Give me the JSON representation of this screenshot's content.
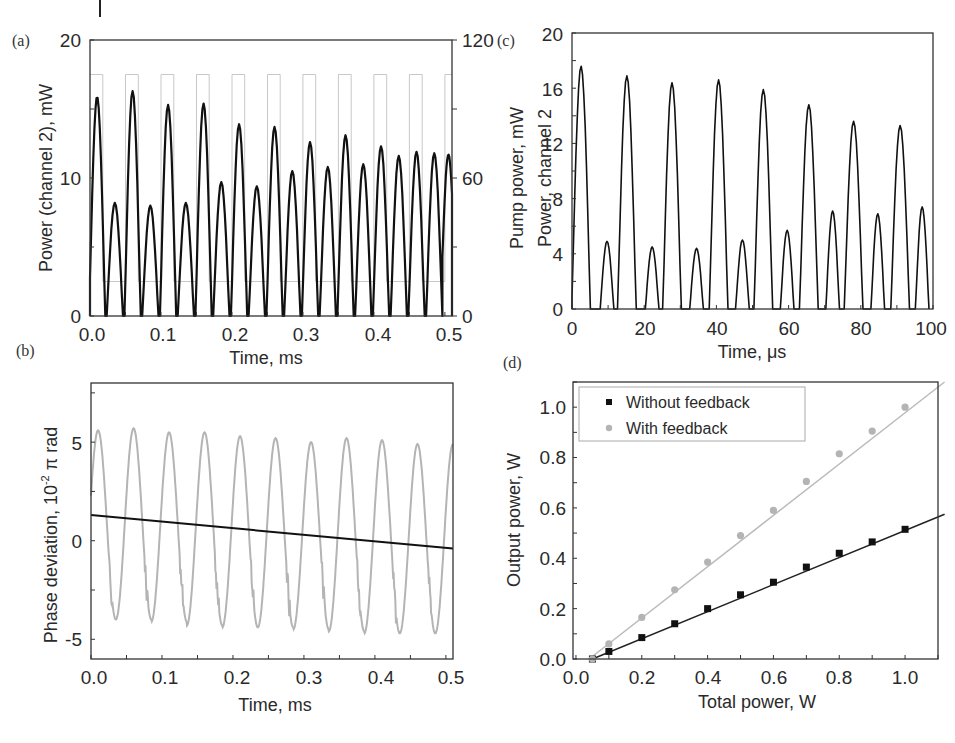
{
  "colors": {
    "black_trace": "#111111",
    "gray_trace": "#b4b4b4",
    "pump_trace": "#c8c8c8",
    "axis": "#333333"
  },
  "panels": {
    "a": {
      "letter": "(a)",
      "xlabel": "Time, ms",
      "ylabel_left": "Power (channel 2), mW",
      "ylabel_right": "Pump power, mW",
      "xticks": [
        "0.0",
        "0.1",
        "0.2",
        "0.3",
        "0.4",
        "0.5"
      ],
      "yticks_left": [
        "0",
        "10",
        "20"
      ],
      "yticks_right": [
        "0",
        "60",
        "120"
      ]
    },
    "b": {
      "letter": "(b)",
      "xlabel": "Time, ms",
      "ylabel": "Phase deviation, 10⁻² π rad",
      "ylabel_main": "Phase deviation, 10",
      "ylabel_sup": "-2",
      "ylabel_tail": " π rad",
      "xticks": [
        "0.0",
        "0.1",
        "0.2",
        "0.3",
        "0.4",
        "0.5"
      ],
      "yticks": [
        "-5",
        "0",
        "5"
      ]
    },
    "c": {
      "letter": "(c)",
      "xlabel": "Time, μs",
      "ylabel": "Power, channel 2",
      "xticks": [
        "0",
        "20",
        "40",
        "60",
        "80",
        "100"
      ],
      "yticks": [
        "0",
        "4",
        "8",
        "12",
        "16",
        "20"
      ]
    },
    "d": {
      "letter": "(d)",
      "xlabel": "Total power, W",
      "ylabel": "Output power, W",
      "xticks": [
        "0.0",
        "0.2",
        "0.4",
        "0.6",
        "0.8",
        "1.0"
      ],
      "yticks": [
        "0.0",
        "0.2",
        "0.4",
        "0.6",
        "0.8",
        "1.0"
      ],
      "legend": [
        "Without feedback",
        "With feedback"
      ]
    }
  },
  "chart_data": [
    {
      "id": "a",
      "type": "line",
      "title": "",
      "xlabel": "Time, ms",
      "ylabel": "Power (channel 2), mW",
      "ylabel_right": "Pump power, mW",
      "xlim": [
        0,
        0.51
      ],
      "ylim": [
        0,
        20
      ],
      "ylim_right": [
        0,
        120
      ],
      "grid": false,
      "series": [
        {
          "name": "Power (channel 2)",
          "axis": "left",
          "color": "#111111",
          "peak_times_ms": [
            0.01,
            0.035,
            0.06,
            0.085,
            0.11,
            0.135,
            0.16,
            0.185,
            0.21,
            0.235,
            0.26,
            0.285,
            0.31,
            0.335,
            0.36,
            0.385,
            0.41,
            0.435,
            0.46,
            0.485,
            0.505
          ],
          "peak_values_mW": [
            15.9,
            8.2,
            16.3,
            8.0,
            15.3,
            8.2,
            15.4,
            9.7,
            13.9,
            9.4,
            13.7,
            10.5,
            12.6,
            10.8,
            13.1,
            11.0,
            12.3,
            11.6,
            11.9,
            11.8,
            11.7
          ],
          "min_value_mW": 0
        },
        {
          "name": "Pump power",
          "axis": "right",
          "color": "#c8c8c8",
          "shape": "square wave",
          "high_mW": 105,
          "low_mW": 15,
          "period_ms": 0.05
        }
      ]
    },
    {
      "id": "b",
      "type": "line",
      "title": "",
      "xlabel": "Time, ms",
      "ylabel": "Phase deviation, 10^-2 π rad",
      "xlim": [
        0,
        0.51
      ],
      "ylim": [
        -6,
        8
      ],
      "grid": false,
      "series": [
        {
          "name": "Phase deviation (oscillating)",
          "color": "#b4b4b4",
          "period_ms": 0.05,
          "peak_times_ms": [
            0.01,
            0.06,
            0.11,
            0.16,
            0.21,
            0.26,
            0.31,
            0.36,
            0.41,
            0.46
          ],
          "peak_values": [
            5.6,
            5.7,
            5.5,
            5.5,
            5.3,
            5.2,
            5.0,
            5.2,
            5.1,
            4.9
          ],
          "trough_values": [
            -4.0,
            -4.0,
            -4.1,
            -4.3,
            -4.4,
            -4.4,
            -4.5,
            -4.6,
            -4.7,
            -4.7
          ]
        },
        {
          "name": "Linear trend",
          "color": "#111111",
          "x": [
            0.0,
            0.51
          ],
          "y": [
            1.3,
            -0.4
          ]
        }
      ]
    },
    {
      "id": "c",
      "type": "line",
      "title": "",
      "xlabel": "Time, μs",
      "ylabel": "Power, channel 2",
      "xlim": [
        0,
        100
      ],
      "ylim": [
        0,
        20
      ],
      "grid": false,
      "series": [
        {
          "name": "Power, channel 2",
          "color": "#111111",
          "peak_times_us": [
            2.5,
            9.7,
            15.2,
            22.2,
            27.7,
            34.5,
            40.6,
            47.2,
            53.0,
            59.6,
            65.6,
            72.2,
            78.0,
            84.7,
            90.9,
            97.0
          ],
          "peak_values": [
            17.6,
            4.9,
            16.9,
            4.5,
            16.4,
            4.4,
            16.6,
            5.0,
            15.9,
            5.7,
            14.8,
            7.1,
            13.6,
            6.9,
            13.3,
            7.4
          ]
        }
      ]
    },
    {
      "id": "d",
      "type": "scatter",
      "title": "",
      "xlabel": "Total power, W",
      "ylabel": "Output power, W",
      "xlim": [
        0,
        1.12
      ],
      "ylim": [
        0,
        1.1
      ],
      "grid": false,
      "legend_position": "upper left",
      "x": [
        0.05,
        0.1,
        0.2,
        0.3,
        0.4,
        0.5,
        0.6,
        0.7,
        0.8,
        0.9,
        1.0
      ],
      "series": [
        {
          "name": "Without feedback",
          "marker": "square",
          "color": "#111111",
          "values": [
            0.0,
            0.03,
            0.085,
            0.14,
            0.2,
            0.255,
            0.305,
            0.365,
            0.42,
            0.465,
            0.515
          ],
          "fit": {
            "x": [
              0.05,
              1.12
            ],
            "y": [
              0.0,
              0.575
            ]
          }
        },
        {
          "name": "With feedback",
          "marker": "circle",
          "color": "#b4b4b4",
          "values": [
            0.0,
            0.06,
            0.165,
            0.275,
            0.385,
            0.49,
            0.59,
            0.705,
            0.815,
            0.905,
            1.0
          ],
          "fit": {
            "x": [
              0.04,
              1.12
            ],
            "y": [
              0.0,
              1.1
            ]
          }
        }
      ]
    }
  ]
}
